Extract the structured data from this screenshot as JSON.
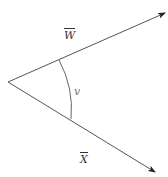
{
  "diagram": {
    "type": "angle-between-vectors",
    "vertex": {
      "x": 8,
      "y": 82
    },
    "vectors": [
      {
        "name": "W",
        "label": "W",
        "overbar": true,
        "tip": {
          "x": 165,
          "y": 13
        }
      },
      {
        "name": "X",
        "label": "X",
        "overbar": true,
        "tip": {
          "x": 155,
          "y": 172
        }
      }
    ],
    "angle": {
      "label": "v",
      "arc_radius": 56
    },
    "colors": {
      "line": "#555555",
      "arrow": "#222222",
      "arc": "#666666",
      "text": "#333333"
    }
  }
}
